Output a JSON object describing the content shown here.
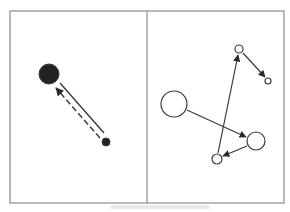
{
  "figure": {
    "frame": {
      "x": 10,
      "y": 11,
      "width": 274,
      "height": 192,
      "stroke": "#8a8a8a"
    },
    "divider": {
      "x": 147
    },
    "colors": {
      "stroke": "#3a3a3a",
      "fill_dark": "#222222",
      "background": "#ffffff"
    },
    "left_panel": {
      "nodes": [
        {
          "id": "L1",
          "cx": 49,
          "cy": 74,
          "r": 10,
          "filled": true
        },
        {
          "id": "L2",
          "cx": 106,
          "cy": 142,
          "r": 4,
          "filled": true
        }
      ],
      "edges": [
        {
          "from": "L2",
          "to": "L1",
          "style": "solid",
          "x1": 60,
          "y1": 83,
          "x2": 104,
          "y2": 133,
          "arrow": false
        },
        {
          "from": "L2",
          "to": "L1",
          "style": "dashed",
          "x1": 100,
          "y1": 138,
          "x2": 56,
          "y2": 88,
          "arrow": true
        }
      ]
    },
    "right_panel": {
      "nodes": [
        {
          "id": "R1",
          "cx": 174,
          "cy": 104,
          "r": 13,
          "filled": false
        },
        {
          "id": "R2",
          "cx": 239,
          "cy": 49,
          "r": 4,
          "filled": false
        },
        {
          "id": "R3",
          "cx": 268,
          "cy": 81,
          "r": 3,
          "filled": false
        },
        {
          "id": "R4",
          "cx": 256,
          "cy": 141,
          "r": 9,
          "filled": false
        },
        {
          "id": "R5",
          "cx": 217,
          "cy": 159,
          "r": 5,
          "filled": false
        }
      ],
      "edges": [
        {
          "from": "R1",
          "to": "R4",
          "x1": 187,
          "y1": 110,
          "x2": 246,
          "y2": 137
        },
        {
          "from": "R5",
          "to": "R2",
          "x1": 218,
          "y1": 153,
          "x2": 238,
          "y2": 55
        },
        {
          "from": "R2",
          "to": "R3",
          "x1": 243,
          "y1": 53,
          "x2": 265,
          "y2": 77
        },
        {
          "from": "R4",
          "to": "R5",
          "x1": 247,
          "y1": 146,
          "x2": 223,
          "y2": 156
        }
      ]
    }
  }
}
